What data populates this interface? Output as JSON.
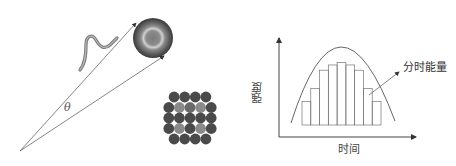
{
  "left_diagram": {
    "angle_label": "θ",
    "elements": [
      "wave-packet",
      "target-sphere",
      "fiber-bundle",
      "convergent-lines"
    ],
    "bundle_rows": [
      [
        "D",
        "D",
        "D",
        "D"
      ],
      [
        "D",
        "L",
        "M",
        "L",
        "D"
      ],
      [
        "D",
        "D",
        "D",
        "D",
        "D"
      ],
      [
        "D",
        "L",
        "D",
        "L",
        "D"
      ],
      [
        "D",
        "D",
        "D",
        "D"
      ]
    ],
    "colors": {
      "dark": "#4a4a4a",
      "light": "#8a8a8a",
      "mid": "#6a6a6a",
      "line": "#666666"
    }
  },
  "chart_data": {
    "type": "bar",
    "title": "",
    "xlabel": "时间",
    "ylabel": "强度",
    "annotation": "分时能量",
    "categories": [
      "1",
      "2",
      "3",
      "4",
      "5",
      "6",
      "7",
      "8",
      "9"
    ],
    "values": [
      27,
      42,
      63,
      69,
      72,
      69,
      63,
      42,
      27
    ],
    "envelope": "parabolic curve over bars",
    "ylim": [
      0,
      100
    ],
    "grid": false,
    "legend": null
  }
}
